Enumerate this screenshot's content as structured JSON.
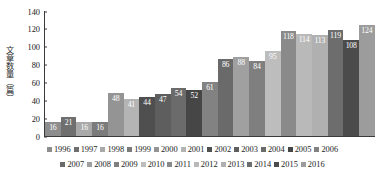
{
  "chart_data": {
    "type": "bar",
    "title": "",
    "xlabel": "",
    "ylabel": "文章数量（篇）",
    "ylim": [
      0,
      140
    ],
    "ytick_labels": [
      "140",
      "120",
      "100",
      "80",
      "60",
      "40",
      "20",
      "0"
    ],
    "ytick_values": [
      140,
      120,
      100,
      80,
      60,
      40,
      20,
      0
    ],
    "grid": false,
    "legend_position": "bottom",
    "categories": [
      "1996",
      "1997",
      "1998",
      "1999",
      "2000",
      "2001",
      "2002",
      "2003",
      "2004",
      "2005",
      "2006",
      "2007",
      "2008",
      "2009",
      "2010",
      "2011",
      "2012",
      "2013",
      "2014",
      "2015",
      "2016"
    ],
    "values": [
      16,
      21,
      16,
      16,
      48,
      41,
      44,
      47,
      54,
      52,
      61,
      86,
      88,
      84,
      95,
      118,
      114,
      113,
      119,
      108,
      124
    ],
    "value_labels": [
      "16",
      "21",
      "16",
      "16",
      "48",
      "41",
      "44",
      "47",
      "54",
      "52",
      "61",
      "86",
      "88",
      "84",
      "95",
      "118",
      "114",
      "113",
      "119",
      "108",
      "124"
    ],
    "bar_colors": [
      "#8d8d8d",
      "#6f6f6f",
      "#a9a9a9",
      "#7b7b7b",
      "#949494",
      "#b4b4b4",
      "#4f4f4f",
      "#5e5e5e",
      "#6b6b6b",
      "#464646",
      "#828282",
      "#6a6a6a",
      "#a0a0a0",
      "#7f7f7f",
      "#bdbdbd",
      "#8a8a8a",
      "#b9b9b9",
      "#b0b0b0",
      "#6d6d6d",
      "#4b4b4b",
      "#9c9c9c"
    ]
  },
  "legend": {
    "row1": [
      "1996",
      "1997",
      "1998",
      "1999",
      "2000",
      "2001",
      "2002",
      "2003",
      "2004",
      "2005",
      "2006"
    ],
    "row2": [
      "2007",
      "2008",
      "2009",
      "2010",
      "2011",
      "2012",
      "2013",
      "2014",
      "2015",
      "2016"
    ]
  }
}
